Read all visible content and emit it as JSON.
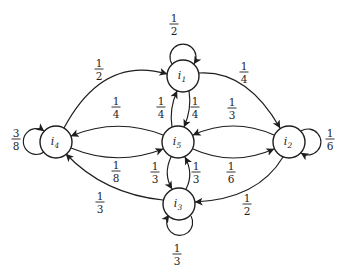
{
  "figure": {
    "type": "markov-chain-state-transition-diagram",
    "background_color": "#ffffff",
    "ink_color": "#1e1e1e",
    "states": [
      {
        "id": "i1",
        "base": "i",
        "subscript": "1"
      },
      {
        "id": "i2",
        "base": "i",
        "subscript": "2"
      },
      {
        "id": "i3",
        "base": "i",
        "subscript": "3"
      },
      {
        "id": "i4",
        "base": "i",
        "subscript": "4"
      },
      {
        "id": "i5",
        "base": "i",
        "subscript": "5"
      }
    ],
    "transitions": [
      {
        "from": "i1",
        "to": "i1",
        "probability": "1/2",
        "numerator": "1",
        "denominator": "2"
      },
      {
        "from": "i1",
        "to": "i2",
        "probability": "1/4",
        "numerator": "1",
        "denominator": "4"
      },
      {
        "from": "i1",
        "to": "i5",
        "probability": "1/4",
        "numerator": "1",
        "denominator": "4"
      },
      {
        "from": "i2",
        "to": "i2",
        "probability": "1/6",
        "numerator": "1",
        "denominator": "6"
      },
      {
        "from": "i2",
        "to": "i5",
        "probability": "1/3",
        "numerator": "1",
        "denominator": "3"
      },
      {
        "from": "i2",
        "to": "i3",
        "probability": "1/2",
        "numerator": "1",
        "denominator": "2"
      },
      {
        "from": "i3",
        "to": "i3",
        "probability": "1/3",
        "numerator": "1",
        "denominator": "3"
      },
      {
        "from": "i3",
        "to": "i5",
        "probability": "1/3",
        "numerator": "1",
        "denominator": "3"
      },
      {
        "from": "i3",
        "to": "i4",
        "probability": "1/3",
        "numerator": "1",
        "denominator": "3"
      },
      {
        "from": "i4",
        "to": "i4",
        "probability": "3/8",
        "numerator": "3",
        "denominator": "8"
      },
      {
        "from": "i4",
        "to": "i1",
        "probability": "1/2",
        "numerator": "1",
        "denominator": "2"
      },
      {
        "from": "i4",
        "to": "i5",
        "probability": "1/8",
        "numerator": "1",
        "denominator": "8"
      },
      {
        "from": "i5",
        "to": "i1",
        "probability": "1/4",
        "numerator": "1",
        "denominator": "4"
      },
      {
        "from": "i5",
        "to": "i4",
        "probability": "1/4",
        "numerator": "1",
        "denominator": "4"
      },
      {
        "from": "i5",
        "to": "i2",
        "probability": "1/6",
        "numerator": "1",
        "denominator": "6"
      },
      {
        "from": "i5",
        "to": "i3",
        "probability": "1/3",
        "numerator": "1",
        "denominator": "3"
      }
    ]
  }
}
